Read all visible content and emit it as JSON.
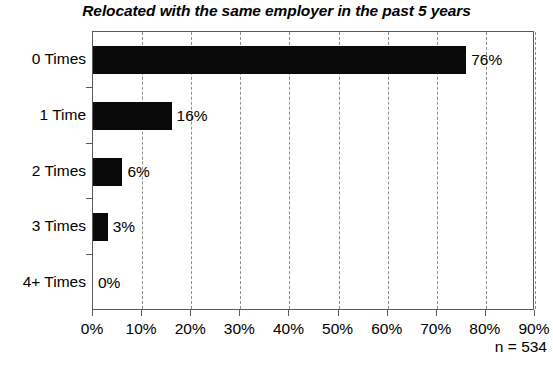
{
  "chart_data": {
    "type": "bar",
    "orientation": "horizontal",
    "title": "Relocated with the same employer in the past 5 years",
    "xlabel": "",
    "ylabel": "",
    "categories": [
      "0 Times",
      "1 Time",
      "2 Times",
      "3 Times",
      "4+ Times"
    ],
    "values": [
      76,
      16,
      6,
      3,
      0
    ],
    "data_labels": [
      "76%",
      "16%",
      "6%",
      "3%",
      "0%"
    ],
    "xlim": [
      0,
      90
    ],
    "xticks": [
      0,
      10,
      20,
      30,
      40,
      50,
      60,
      70,
      80,
      90
    ],
    "xticklabels": [
      "0%",
      "10%",
      "20%",
      "30%",
      "40%",
      "50%",
      "60%",
      "70%",
      "80%",
      "90%"
    ],
    "grid": "vertical-dashed",
    "legend": "none",
    "annotation": "n = 534",
    "bar_color": "#0a0a0a",
    "grid_color": "#8d8d8d",
    "axis_color": "#5a5a5a",
    "background": "#ffffff"
  }
}
